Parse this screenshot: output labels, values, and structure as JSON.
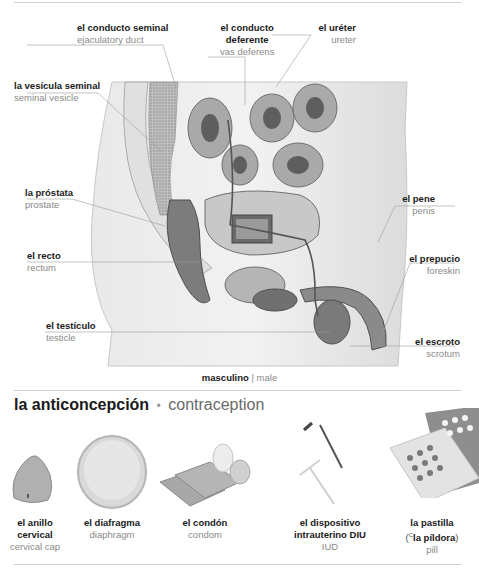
{
  "anatomy": {
    "caption": {
      "es": "masculino",
      "sep": "|",
      "en": "male"
    },
    "labels": [
      {
        "id": "ejaculatory-duct",
        "es": "el conducto seminal",
        "en": "ejaculatory duct"
      },
      {
        "id": "vas-deferens",
        "es": "el conducto deferente",
        "es_line1": "el conducto",
        "es_line2": "deferente",
        "en": "vas deferens"
      },
      {
        "id": "ureter",
        "es": "el uréter",
        "en": "ureter"
      },
      {
        "id": "seminal-vesicle",
        "es": "la vesícula seminal",
        "en": "seminal vesicle"
      },
      {
        "id": "prostate",
        "es": "la próstata",
        "en": "prostate"
      },
      {
        "id": "penis",
        "es": "el pene",
        "en": "penis"
      },
      {
        "id": "rectum",
        "es": "el recto",
        "en": "rectum"
      },
      {
        "id": "foreskin",
        "es": "el prepucio",
        "en": "foreskin"
      },
      {
        "id": "testicle",
        "es": "el testículo",
        "en": "testicle"
      },
      {
        "id": "scrotum",
        "es": "el escroto",
        "en": "scrotum"
      }
    ]
  },
  "contraception": {
    "title": {
      "es": "la anticoncepción",
      "bullet": "•",
      "en": "contraception"
    },
    "items": [
      {
        "id": "cervical-cap",
        "es_line1": "el anillo",
        "es_line2": "cervical",
        "en": "cervical cap"
      },
      {
        "id": "diaphragm",
        "es_line1": "el diafragma",
        "en": "diaphragm"
      },
      {
        "id": "condom",
        "es_line1": "el condón",
        "en": "condom"
      },
      {
        "id": "iud",
        "es_line1": "el dispositivo",
        "es_line2": "intrauterino DIU",
        "en": "IUD"
      },
      {
        "id": "pill",
        "es_line1": "la pastilla",
        "es_line2_prefix": "(",
        "es_line2_sup": "C",
        "es_line2": "la píldora",
        "es_line2_suffix": ")",
        "en": "pill"
      }
    ]
  },
  "colors": {
    "rule": "#cfcfcf",
    "label_es": "#1a1a1a",
    "label_en": "#8a8a8a"
  }
}
